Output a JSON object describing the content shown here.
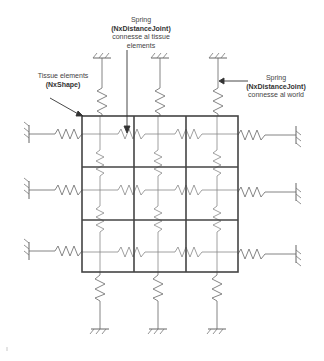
{
  "diagram": {
    "labels": {
      "top": {
        "line1": "Spring",
        "line2": "(NxDistanceJoint)",
        "line3": "connesse al tissue",
        "line4": "elements"
      },
      "left": {
        "line1": "Tissue elements",
        "line2": "(NxShape)"
      },
      "right": {
        "line1": "Spring",
        "line2": "(NxDistanceJoint)",
        "line3": "connesse al world"
      }
    },
    "grid": {
      "rows": 3,
      "cols": 3
    },
    "colors": {
      "grid": "#444444",
      "spring": "#777777",
      "text": "#444444"
    }
  }
}
